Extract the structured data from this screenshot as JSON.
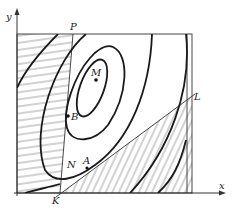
{
  "figure": {
    "type": "diagram",
    "axes": {
      "x_label": "x",
      "y_label": "y"
    },
    "points": [
      {
        "id": "P",
        "label": "P"
      },
      {
        "id": "M",
        "label": "M"
      },
      {
        "id": "B",
        "label": "B"
      },
      {
        "id": "A",
        "label": "A"
      },
      {
        "id": "N",
        "label": "N"
      },
      {
        "id": "K",
        "label": "K"
      },
      {
        "id": "L",
        "label": "L"
      }
    ],
    "colors": {
      "line": "#1a1a1a",
      "hatch": "#666666",
      "background": "#ffffff"
    }
  }
}
